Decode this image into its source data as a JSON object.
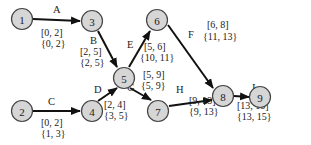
{
  "diagram": {
    "type": "activity-network",
    "nodes": [
      {
        "id": "1",
        "label": "1",
        "x": 22,
        "y": 19
      },
      {
        "id": "2",
        "label": "2",
        "x": 22,
        "y": 111
      },
      {
        "id": "3",
        "label": "3",
        "x": 92,
        "y": 21
      },
      {
        "id": "4",
        "label": "4",
        "x": 92,
        "y": 111
      },
      {
        "id": "5",
        "label": "5",
        "x": 124,
        "y": 78
      },
      {
        "id": "6",
        "label": "6",
        "x": 157,
        "y": 20
      },
      {
        "id": "7",
        "label": "7",
        "x": 158,
        "y": 111
      },
      {
        "id": "8",
        "label": "8",
        "x": 223,
        "y": 96
      },
      {
        "id": "9",
        "label": "9",
        "x": 260,
        "y": 97
      }
    ],
    "edges": [
      {
        "name": "A",
        "from": "1",
        "to": "3",
        "early": "[0, 2]",
        "late": "{0, 2}"
      },
      {
        "name": "B",
        "from": "3",
        "to": "5",
        "early": "[2, 5]",
        "late": "{2, 5}"
      },
      {
        "name": "C",
        "from": "2",
        "to": "4",
        "early": "[0, 2]",
        "late": "{1, 3}"
      },
      {
        "name": "D",
        "from": "4",
        "to": "5",
        "early": "[2, 4]",
        "late": "{3, 5}"
      },
      {
        "name": "E",
        "from": "5",
        "to": "6",
        "early": "[5, 6]",
        "late": "{10, 11}"
      },
      {
        "name": "F",
        "from": "6",
        "to": "8",
        "early": "[6, 8]",
        "late": "{11, 13}"
      },
      {
        "name": "G",
        "from": "5",
        "to": "7",
        "early": "[5, 9]",
        "late": "{5, 9}"
      },
      {
        "name": "H",
        "from": "7",
        "to": "8",
        "early": "[9, 13]",
        "late": "{9, 13}"
      },
      {
        "name": "I",
        "from": "8",
        "to": "9",
        "early": "[13, 15]",
        "late": "{13, 15}"
      }
    ]
  }
}
